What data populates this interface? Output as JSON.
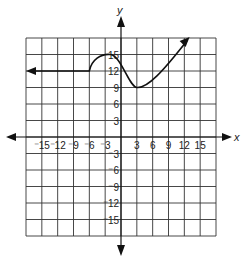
{
  "chart_data": {
    "type": "line",
    "title": "",
    "xlabel": "x",
    "ylabel": "y",
    "xlim": [
      -18,
      18
    ],
    "ylim": [
      -18,
      18
    ],
    "grid": true,
    "grid_step": 3,
    "x_tick_labels": [
      "-15",
      "-12",
      "-9",
      "-6",
      "-3",
      "3",
      "6",
      "9",
      "12",
      "15"
    ],
    "y_tick_labels": [
      "15",
      "12",
      "9",
      "6",
      "3",
      "-3",
      "-6",
      "-9",
      "-12",
      "-15"
    ],
    "series": [
      {
        "name": "f(x)",
        "description": "Constant y=12 extending left (arrow) to x=-6, rises to local max ~15 near x=-2, falls to local min 9 at x=3, then increases past top-right (arrow)",
        "x": [
          -18,
          -15,
          -12,
          -9,
          -6,
          -4,
          -2,
          0,
          3,
          6,
          9,
          12,
          13
        ],
        "y": [
          12,
          12,
          12,
          12,
          12,
          14.5,
          15,
          13,
          9,
          10.5,
          13.5,
          17,
          18
        ],
        "left_arrow": true,
        "right_arrow": true
      }
    ]
  },
  "axes": {
    "x_label": "x",
    "y_label": "y"
  }
}
